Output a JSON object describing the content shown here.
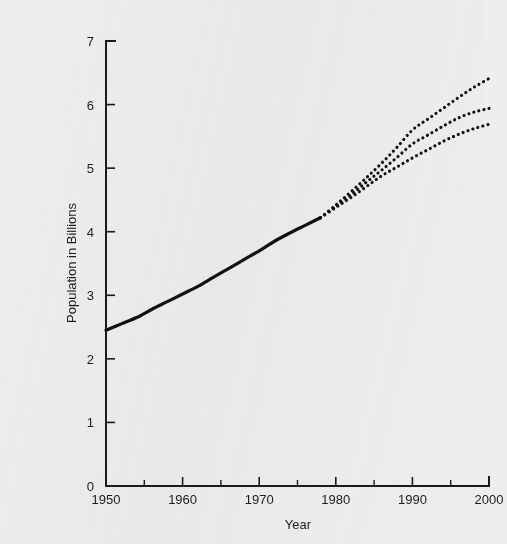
{
  "figure": {
    "background_color": "#eeeeec",
    "ink_color": "#111111",
    "axis_color": "#1a1a1a"
  },
  "chart_data": {
    "type": "line",
    "title": "",
    "subtitle": "",
    "xlabel": "Year",
    "ylabel": "Population in Billions",
    "xlim": [
      1950,
      2000
    ],
    "ylim": [
      0,
      7
    ],
    "grid": false,
    "legend": null,
    "legend_position": "none",
    "x_ticks": [
      1950,
      1960,
      1970,
      1980,
      1990,
      2000
    ],
    "x_tick_labels": [
      "1950",
      "1960",
      "1970",
      "1980",
      "1990",
      "2000"
    ],
    "x_minor_ticks": [
      1955,
      1965,
      1975,
      1985,
      1995
    ],
    "y_ticks": [
      0,
      1,
      2,
      3,
      4,
      5,
      6,
      7
    ],
    "y_tick_labels": [
      "0",
      "1",
      "2",
      "3",
      "4",
      "5",
      "6",
      "7"
    ],
    "annotations": [
      "Solid segment is observed history (1950-1978); dotted segments are three projection variants (1978-2000)."
    ],
    "series": [
      {
        "name": "Observed population",
        "style": "solid",
        "x": [
          1950,
          1952,
          1954,
          1956,
          1958,
          1960,
          1962,
          1964,
          1966,
          1968,
          1970,
          1972,
          1974,
          1976,
          1978
        ],
        "values": [
          2.45,
          2.55,
          2.65,
          2.78,
          2.9,
          3.02,
          3.14,
          3.28,
          3.42,
          3.56,
          3.7,
          3.85,
          3.98,
          4.1,
          4.22
        ]
      },
      {
        "name": "High projection",
        "style": "dotted",
        "x": [
          1978,
          1980,
          1982,
          1984,
          1986,
          1988,
          1990,
          1992,
          1994,
          1996,
          1998,
          2000
        ],
        "values": [
          4.22,
          4.42,
          4.63,
          4.85,
          5.08,
          5.33,
          5.6,
          5.77,
          5.94,
          6.11,
          6.27,
          6.41
        ]
      },
      {
        "name": "Medium projection",
        "style": "dotted",
        "x": [
          1978,
          1980,
          1982,
          1984,
          1986,
          1988,
          1990,
          1992,
          1994,
          1996,
          1998,
          2000
        ],
        "values": [
          4.22,
          4.4,
          4.58,
          4.78,
          4.97,
          5.17,
          5.38,
          5.52,
          5.66,
          5.79,
          5.88,
          5.94
        ]
      },
      {
        "name": "Low projection",
        "style": "dotted",
        "x": [
          1978,
          1980,
          1982,
          1984,
          1986,
          1988,
          1990,
          1992,
          1994,
          1996,
          1998,
          2000
        ],
        "values": [
          4.22,
          4.38,
          4.54,
          4.71,
          4.88,
          5.02,
          5.16,
          5.29,
          5.42,
          5.53,
          5.62,
          5.69
        ]
      }
    ]
  },
  "plot_geometry": {
    "left": 66,
    "right": 449,
    "top": 25,
    "bottom": 470,
    "tick_major_length": 9,
    "tick_minor_length": 6
  }
}
